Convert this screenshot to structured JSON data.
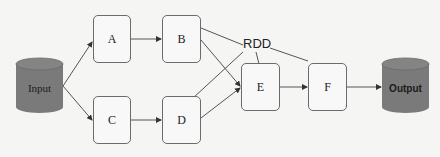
{
  "diagram": {
    "source": {
      "label": "Input"
    },
    "sink": {
      "label": "Output"
    },
    "nodes": [
      {
        "id": "A",
        "label": "A"
      },
      {
        "id": "B",
        "label": "B"
      },
      {
        "id": "C",
        "label": "C"
      },
      {
        "id": "D",
        "label": "D"
      },
      {
        "id": "E",
        "label": "E"
      },
      {
        "id": "F",
        "label": "F"
      }
    ],
    "annotation": {
      "label": "RDD"
    },
    "edges": [
      [
        "Input",
        "A"
      ],
      [
        "Input",
        "C"
      ],
      [
        "A",
        "B"
      ],
      [
        "C",
        "D"
      ],
      [
        "B",
        "E"
      ],
      [
        "D",
        "E"
      ],
      [
        "E",
        "F"
      ],
      [
        "F",
        "Output"
      ]
    ],
    "colors": {
      "cylinder_fill": "#7a7a7a",
      "node_border": "#6b6b6b",
      "edge": "#555555"
    }
  }
}
